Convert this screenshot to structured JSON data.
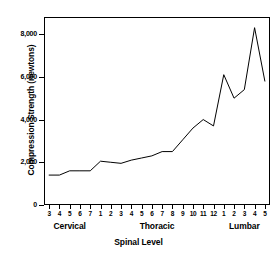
{
  "chart_data": {
    "type": "line",
    "title": "",
    "xlabel": "Spinal Level",
    "ylabel": "Compression Strength (newtons)",
    "ylim": [
      0,
      8800
    ],
    "yticks": [
      0,
      2000,
      4000,
      6000,
      8000
    ],
    "ytick_labels": [
      "0",
      "2,000",
      "4,000",
      "6,000",
      "8,000"
    ],
    "grid": false,
    "legend": null,
    "categories": [
      "3",
      "4",
      "5",
      "6",
      "7",
      "1",
      "2",
      "3",
      "4",
      "5",
      "6",
      "7",
      "8",
      "9",
      "10",
      "11",
      "12",
      "1",
      "2",
      "3",
      "4",
      "5"
    ],
    "values": [
      1400,
      1400,
      1600,
      1600,
      1600,
      2050,
      2000,
      1950,
      2100,
      2200,
      2300,
      2500,
      2500,
      3050,
      3600,
      4000,
      3700,
      6100,
      5000,
      5400,
      8300,
      5800
    ],
    "groups": [
      {
        "label": "Cervical",
        "start_index": 0,
        "end_index": 4
      },
      {
        "label": "Thoracic",
        "start_index": 5,
        "end_index": 16
      },
      {
        "label": "Lumbar",
        "start_index": 17,
        "end_index": 21
      }
    ],
    "series": [
      {
        "name": "Compression Strength",
        "color": "#000000",
        "values": [
          1400,
          1400,
          1600,
          1600,
          1600,
          2050,
          2000,
          1950,
          2100,
          2200,
          2300,
          2500,
          2500,
          3050,
          3600,
          4000,
          3700,
          6100,
          5000,
          5400,
          8300,
          5800
        ]
      }
    ]
  },
  "colors": {
    "line": "#000000",
    "axis": "#000000",
    "background": "#ffffff"
  }
}
